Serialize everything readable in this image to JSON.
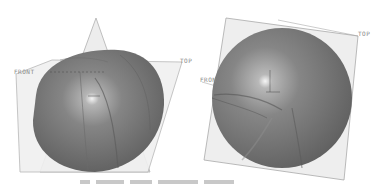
{
  "figure": {
    "views": [
      {
        "id": "left",
        "description": "hemispherical dome shell with datum planes",
        "labels": {
          "front": "FRONT",
          "top": "TOP"
        }
      },
      {
        "id": "right",
        "description": "sphere with datum planes",
        "labels": {
          "front": "FRON",
          "top": "TOP"
        }
      }
    ],
    "colors": {
      "surface": "#7a7a7a",
      "highlight": "#f2f2f2",
      "plane_fill": "#ececec",
      "plane_edge": "#a8a8a8",
      "background": "#ffffff"
    }
  }
}
